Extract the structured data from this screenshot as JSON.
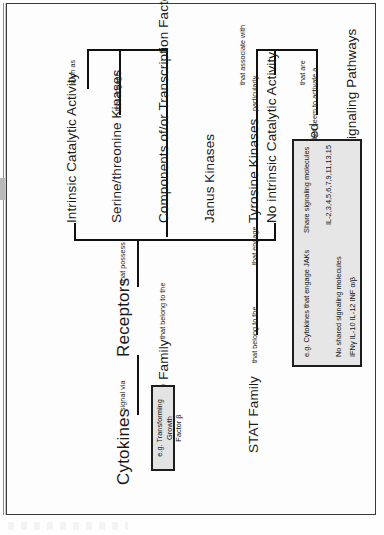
{
  "diagram": {
    "title": "Cytokines",
    "orientation": "rotated-90-ccw",
    "nodes": {
      "cytokines": "Cytokines",
      "receptors": "Receptors",
      "no_intrinsic": "No intrinsic Catalytic Activity",
      "intrinsic": "Intrinsic Catalytic Activity",
      "poorly_resolved": "Poorly Resolved",
      "multitude": "Multitude of Signaling Pathways",
      "tyrosine_kinases": "Tyrosine Kinases",
      "janus_kinases": "Janus Kinases",
      "latent_tf": "Latent Transcription Factors",
      "stat_family": "STAT Family",
      "serine_threonine": "Serine/threonine Kinases",
      "components_tf": "Components of/or Transcription Factors",
      "smad_family": "SMAD Family"
    },
    "links": {
      "signal_via": "signal via",
      "that_possess": "that possess",
      "that_are": "that are",
      "but_seem": "but seem  to activate a",
      "that_associate_with": "that associate with",
      "particularly": "particularly",
      "that_engage_1": "that engage",
      "that_belong_to_the_1": "that belong to the",
      "such_as": "such as",
      "that_engage_2": "that engage",
      "that_belong_to_the_2": "that belong to the"
    },
    "example_boxes": [
      {
        "id": "tnf-box",
        "lines": [
          "e.g. Tumor Necrosis Factor"
        ]
      },
      {
        "id": "tgf-box",
        "lines": [
          "e.g. Transforming Growth",
          "Factor β"
        ]
      }
    ],
    "legend": {
      "col1_header": "e.g. Cytokines that engage JAKs",
      "col2_header": "Share signaling molecules",
      "col2_values": "IL-2,3,4,5,6,7,9,11,13,15",
      "row2_header": "No shared signaling molecules",
      "row2_values": "IFNγ  IL-10  IL-12  INF α/β"
    }
  }
}
